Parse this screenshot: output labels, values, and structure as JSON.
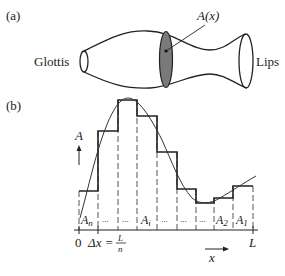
{
  "panel_a": {
    "label": "(a)",
    "left_label": "Glottis",
    "right_label": "Lips",
    "section_label": "A(x)"
  },
  "panel_b": {
    "label": "(b)",
    "y_axis_label": "A",
    "x_axis_label": "x",
    "origin_label": "0",
    "end_label": "L",
    "dx_label": "Δx =",
    "dx_num": "L",
    "dx_den": "n",
    "segment_labels": [
      {
        "main": "A",
        "sub": "n"
      },
      {
        "main": "...",
        "sub": ""
      },
      {
        "main": "...",
        "sub": ""
      },
      {
        "main": "A",
        "sub": "i"
      },
      {
        "main": "...",
        "sub": ""
      },
      {
        "main": "...",
        "sub": ""
      },
      {
        "main": "...",
        "sub": ""
      },
      {
        "main": "A",
        "sub": "2"
      },
      {
        "main": "A",
        "sub": "1"
      }
    ],
    "step_heights_px": [
      191,
      131,
      100,
      116,
      152,
      189,
      203,
      198,
      186
    ]
  },
  "colors": {
    "ink": "#222222",
    "shade": "#7a7a7a"
  }
}
